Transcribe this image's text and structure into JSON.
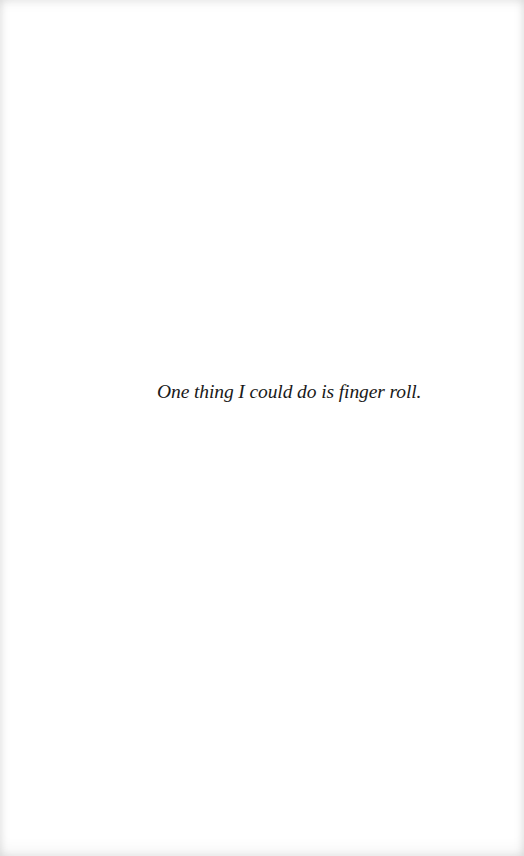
{
  "page": {
    "background": "#ffffff",
    "text_color": "#1a1a1a",
    "lines": [
      {
        "text": "One thing I could do is finger roll.",
        "style": "italic"
      }
    ]
  }
}
